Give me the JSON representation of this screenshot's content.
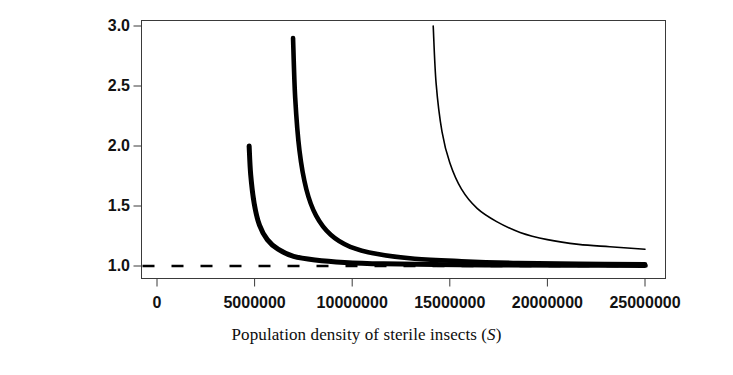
{
  "figure": {
    "background_color": "#ffffff",
    "axis_color": "#3a3a3a",
    "curve_color": "#000000"
  },
  "chart_data": {
    "type": "line",
    "title": "",
    "subtitle": "",
    "xlabel_text": "Population density of sterile insects (",
    "xlabel_variable": "S",
    "xlabel_suffix": ")",
    "ylabel_line1": "Relative time for eradication of",
    "ylabel_line2": "related species",
    "xlim": [
      0,
      25000000
    ],
    "ylim": [
      1.0,
      3.0
    ],
    "xticks": [
      0,
      5000000,
      10000000,
      15000000,
      20000000,
      25000000
    ],
    "xtick_labels": [
      "0",
      "5000000",
      "10000000",
      "15000000",
      "20000000",
      "25000000"
    ],
    "yticks": [
      1.0,
      1.5,
      2.0,
      2.5,
      3.0
    ],
    "ytick_labels": [
      "1.0",
      "1.5",
      "2.0",
      "2.5",
      "3.0"
    ],
    "grid": false,
    "legend": null,
    "legend_position": "none",
    "reference_line": {
      "name": "asymptote-y-equals-one",
      "y": 1.0,
      "style": "dashed",
      "color": "#000000",
      "dash_length_px": 12,
      "gap_length_px": 17
    },
    "series": [
      {
        "name": "curve-1-thin",
        "line_width_px": 1.6,
        "color": "#000000",
        "asymptote_x": 14150000,
        "asymptote_y": 1.0,
        "y_at_xmax": 1.14,
        "top_y": 3.0,
        "x": [
          14150000,
          14300000,
          14600000,
          15000000,
          15600000,
          16400000,
          17400000,
          18600000,
          20000000,
          21600000,
          23200000,
          25000000
        ],
        "y": [
          3.0,
          2.52,
          2.12,
          1.86,
          1.64,
          1.48,
          1.37,
          1.28,
          1.22,
          1.18,
          1.16,
          1.14
        ]
      },
      {
        "name": "curve-2-thick",
        "line_width_px": 4.6,
        "color": "#000000",
        "asymptote_x": 6970000,
        "asymptote_y": 1.0,
        "y_at_xmax": 1.015,
        "top_y": 2.9,
        "x": [
          6970000,
          7080000,
          7300000,
          7650000,
          8150000,
          8900000,
          9900000,
          11300000,
          13200000,
          15600000,
          18500000,
          21600000,
          25000000
        ],
        "y": [
          2.9,
          2.4,
          1.96,
          1.64,
          1.42,
          1.26,
          1.16,
          1.1,
          1.06,
          1.04,
          1.025,
          1.018,
          1.015
        ]
      },
      {
        "name": "curve-3-thick",
        "line_width_px": 5.0,
        "color": "#000000",
        "asymptote_x": 4720000,
        "asymptote_y": 1.0,
        "y_at_xmax": 1.005,
        "top_y": 2.0,
        "x": [
          4720000,
          4800000,
          4980000,
          5250000,
          5650000,
          6200000,
          7000000,
          8100000,
          9600000,
          11600000,
          14200000,
          17500000,
          21000000,
          25000000
        ],
        "y": [
          2.0,
          1.76,
          1.52,
          1.34,
          1.22,
          1.14,
          1.08,
          1.05,
          1.03,
          1.018,
          1.012,
          1.008,
          1.006,
          1.005
        ]
      }
    ]
  }
}
